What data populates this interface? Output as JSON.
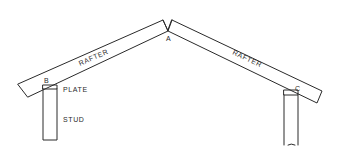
{
  "diagram": {
    "title": "",
    "ink_color": "#2a2a2a",
    "background": "#ffffff",
    "members": [
      {
        "id": "left-rafter",
        "label": "RAFTER"
      },
      {
        "id": "right-rafter",
        "label": "RAFTER"
      },
      {
        "id": "left-plate",
        "label": "PLATE"
      },
      {
        "id": "left-stud",
        "label": "STUD"
      },
      {
        "id": "right-plate",
        "label": ""
      },
      {
        "id": "right-stud",
        "label": ""
      }
    ],
    "points": [
      {
        "id": "A",
        "label": "A",
        "description": "ridge / apex where rafters meet"
      },
      {
        "id": "B",
        "label": "B",
        "description": "left rafter bearing on plate"
      },
      {
        "id": "C",
        "label": "C",
        "description": "right rafter bearing on plate"
      }
    ]
  }
}
